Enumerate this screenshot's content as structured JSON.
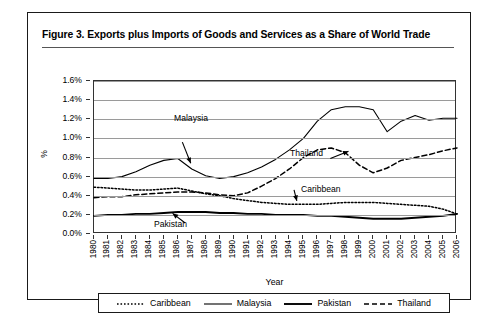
{
  "figure": {
    "title": "Figure 3.  Exports plus Imports of Goods and Services as a Share of World Trade"
  },
  "axes": {
    "y_title": "%",
    "x_title": "Year",
    "y_ticks": [
      "0.0%",
      "0.2%",
      "0.4%",
      "0.6%",
      "0.8%",
      "1.0%",
      "1.2%",
      "1.4%",
      "1.6%"
    ]
  },
  "annotations": [
    {
      "name": "malaysia",
      "label": "Malaysia"
    },
    {
      "name": "thailand",
      "label": "Thailand"
    },
    {
      "name": "caribbean",
      "label": "Caribbean"
    },
    {
      "name": "pakistan",
      "label": "Pakistan"
    }
  ],
  "legend": {
    "items": [
      {
        "label": "Caribbean",
        "style": "dotted",
        "color": "#000000"
      },
      {
        "label": "Malaysia",
        "style": "solid-thin",
        "color": "#000000"
      },
      {
        "label": "Pakistan",
        "style": "solid-thick",
        "color": "#000000"
      },
      {
        "label": "Thailand",
        "style": "dashed",
        "color": "#000000"
      }
    ]
  },
  "chart_data": {
    "type": "line",
    "title": "Exports plus Imports of Goods and Services as a Share of World Trade",
    "xlabel": "Year",
    "ylabel": "%",
    "ylim": [
      0.0,
      1.6
    ],
    "yticks": [
      0.0,
      0.2,
      0.4,
      0.6,
      0.8,
      1.0,
      1.2,
      1.4,
      1.6
    ],
    "grid": true,
    "legend_position": "bottom",
    "x": [
      1980,
      1981,
      1982,
      1983,
      1984,
      1985,
      1986,
      1987,
      1988,
      1989,
      1990,
      1991,
      1992,
      1993,
      1994,
      1995,
      1996,
      1997,
      1998,
      1999,
      2000,
      2001,
      2002,
      2003,
      2004,
      2005,
      2006
    ],
    "series": [
      {
        "name": "Caribbean",
        "style": "dotted",
        "values": [
          0.49,
          0.48,
          0.47,
          0.46,
          0.46,
          0.47,
          0.48,
          0.45,
          0.42,
          0.4,
          0.37,
          0.35,
          0.33,
          0.32,
          0.31,
          0.31,
          0.31,
          0.32,
          0.33,
          0.33,
          0.33,
          0.32,
          0.31,
          0.3,
          0.29,
          0.26,
          0.21
        ]
      },
      {
        "name": "Malaysia",
        "style": "solid-thin",
        "values": [
          0.58,
          0.58,
          0.6,
          0.65,
          0.72,
          0.77,
          0.79,
          0.68,
          0.61,
          0.58,
          0.6,
          0.64,
          0.7,
          0.78,
          0.88,
          1.0,
          1.18,
          1.3,
          1.33,
          1.33,
          1.3,
          1.07,
          1.18,
          1.24,
          1.19,
          1.21,
          1.21
        ]
      },
      {
        "name": "Pakistan",
        "style": "solid-thick",
        "values": [
          0.19,
          0.2,
          0.2,
          0.21,
          0.21,
          0.22,
          0.23,
          0.23,
          0.23,
          0.22,
          0.22,
          0.21,
          0.21,
          0.2,
          0.2,
          0.2,
          0.19,
          0.19,
          0.18,
          0.17,
          0.16,
          0.16,
          0.16,
          0.17,
          0.18,
          0.19,
          0.21
        ]
      },
      {
        "name": "Thailand",
        "style": "dashed",
        "values": [
          0.38,
          0.39,
          0.39,
          0.41,
          0.42,
          0.43,
          0.44,
          0.44,
          0.43,
          0.41,
          0.4,
          0.43,
          0.5,
          0.58,
          0.68,
          0.8,
          0.88,
          0.9,
          0.85,
          0.72,
          0.64,
          0.69,
          0.77,
          0.8,
          0.83,
          0.87,
          0.9
        ]
      }
    ]
  }
}
